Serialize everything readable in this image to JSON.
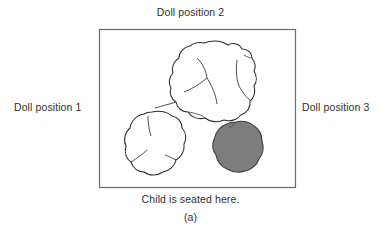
{
  "figure": {
    "caption": "(a)",
    "labels": {
      "top": "Doll position 2",
      "left": "Doll position 1",
      "right": "Doll position 3",
      "bottom": "Child is seated here."
    }
  },
  "colors": {
    "background": "#ffffff",
    "border": "#6b6b6b",
    "ink": "#2f2f2f",
    "outline_stroke": "#2a2a2a",
    "gray_blob_fill": "#7d7d7d",
    "gray_blob_stroke": "#3a3a3a",
    "white_blob_fill": "#ffffff"
  },
  "scene": {
    "room": {
      "name": "display-table-boundary",
      "x": 99,
      "y": 29,
      "width": 197,
      "height": 159
    },
    "objects": [
      {
        "name": "large-white-mound",
        "fill": "white",
        "approx_bounds": {
          "x": 170,
          "y": 42,
          "width": 86,
          "height": 79
        }
      },
      {
        "name": "small-white-mound",
        "fill": "white",
        "approx_bounds": {
          "x": 124,
          "y": 111,
          "width": 62,
          "height": 65
        }
      },
      {
        "name": "gray-mound",
        "fill": "gray",
        "approx_bounds": {
          "x": 211,
          "y": 122,
          "width": 52,
          "height": 50
        }
      }
    ]
  }
}
